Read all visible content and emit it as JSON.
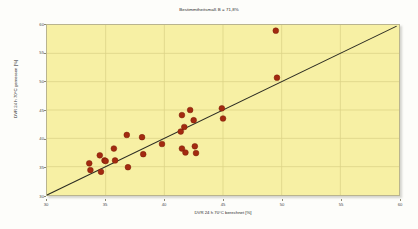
{
  "chart_data": {
    "type": "scatter",
    "title": "Bestimmtheitsmaß B = 71,8%",
    "xlabel": "DVR 24 h 70°C berechnet [%]",
    "ylabel": "DVR 24 h 70°C gemessen [%]",
    "xlim": [
      30,
      60
    ],
    "ylim": [
      30,
      60
    ],
    "xticks": [
      30,
      35,
      40,
      45,
      50,
      55,
      60
    ],
    "yticks": [
      30,
      35,
      40,
      45,
      50,
      55,
      60
    ],
    "grid": true,
    "legend": "none",
    "marker_color": "#a32a10",
    "marker_edge_color": "#7a1c08",
    "line_color": "#2b2b22",
    "plot_background": "#f7f0a4",
    "points": [
      {
        "x": 33.6,
        "y": 35.6
      },
      {
        "x": 33.7,
        "y": 34.4
      },
      {
        "x": 34.5,
        "y": 37.0
      },
      {
        "x": 34.6,
        "y": 34.1
      },
      {
        "x": 34.9,
        "y": 36.1
      },
      {
        "x": 35.0,
        "y": 36.0
      },
      {
        "x": 35.7,
        "y": 38.2
      },
      {
        "x": 35.8,
        "y": 36.1
      },
      {
        "x": 36.8,
        "y": 40.6
      },
      {
        "x": 36.9,
        "y": 34.9
      },
      {
        "x": 38.1,
        "y": 40.2
      },
      {
        "x": 38.2,
        "y": 37.2
      },
      {
        "x": 39.8,
        "y": 39.0
      },
      {
        "x": 41.4,
        "y": 41.2
      },
      {
        "x": 41.5,
        "y": 44.1
      },
      {
        "x": 41.5,
        "y": 38.2
      },
      {
        "x": 41.7,
        "y": 42.0
      },
      {
        "x": 41.8,
        "y": 37.5
      },
      {
        "x": 42.2,
        "y": 45.0
      },
      {
        "x": 42.5,
        "y": 43.2
      },
      {
        "x": 42.6,
        "y": 38.6
      },
      {
        "x": 42.7,
        "y": 37.4
      },
      {
        "x": 44.9,
        "y": 45.3
      },
      {
        "x": 45.0,
        "y": 43.5
      },
      {
        "x": 49.5,
        "y": 59.0
      },
      {
        "x": 49.6,
        "y": 50.7
      }
    ],
    "regression_line": {
      "label": "Regressionsgerade",
      "x0": 30.0,
      "y0": 30.0,
      "x1": 59.8,
      "y1": 59.8
    }
  }
}
